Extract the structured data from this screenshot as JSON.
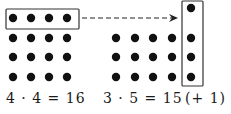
{
  "diagram": {
    "colors": {
      "dot": "#111111",
      "box": "#333333",
      "arrow": "#222222",
      "background": "#ffffff"
    },
    "left_group": {
      "rows": 4,
      "cols": 4,
      "dot_x": [
        13,
        31,
        49,
        67
      ],
      "dot_y": [
        18,
        38,
        57,
        77
      ],
      "highlight_box": {
        "x": 6,
        "y": 9,
        "w": 73,
        "h": 20,
        "label": "top row moved"
      }
    },
    "right_group": {
      "rows": 3,
      "cols": 5,
      "dot_x": [
        116,
        135,
        153,
        172,
        191
      ],
      "dot_y": [
        38,
        57,
        77
      ],
      "extra_dot": {
        "x": 191,
        "y": 8
      },
      "highlight_box": {
        "x": 182,
        "y": 1,
        "w": 21,
        "h": 85
      }
    },
    "arrow": {
      "x1": 82,
      "y1": 18,
      "x2": 178,
      "y2": 18,
      "style": "dashed"
    }
  },
  "equations": {
    "left": "4 · 4 = 16",
    "right": "3 · 5 = 15",
    "remainder": "(+  1)"
  }
}
